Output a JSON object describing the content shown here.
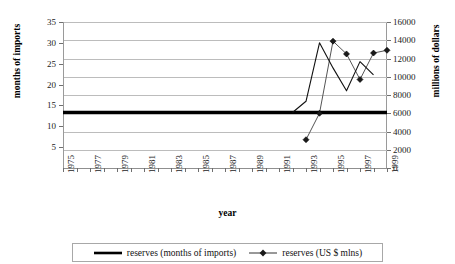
{
  "chart_data": {
    "type": "line",
    "title": "",
    "xlabel": "year",
    "ylabel": "months of imports",
    "y2label": "millions of dollars",
    "grid": true,
    "legend_position": "bottom",
    "x": [
      1975,
      1976,
      1977,
      1978,
      1979,
      1980,
      1981,
      1982,
      1983,
      1984,
      1985,
      1986,
      1987,
      1988,
      1989,
      1990,
      1991,
      1992,
      1993,
      1994,
      1995,
      1996,
      1997,
      1998,
      1999
    ],
    "xtick_labels": [
      "1975",
      "1977",
      "1979",
      "1981",
      "1983",
      "1985",
      "1987",
      "1989",
      "1991",
      "1993",
      "1995",
      "1997",
      "1999"
    ],
    "ylim": [
      0,
      35
    ],
    "ytick_labels": [
      "5",
      "10",
      "15",
      "20",
      "25",
      "30",
      "35"
    ],
    "ytick_values": [
      5,
      10,
      15,
      20,
      25,
      30,
      35
    ],
    "y2lim": [
      0,
      16000
    ],
    "y2tick_labels": [
      "0",
      "2000",
      "4000",
      "6000",
      "8000",
      "10000",
      "12000",
      "14000",
      "16000"
    ],
    "y2tick_values": [
      0,
      2000,
      4000,
      6000,
      8000,
      10000,
      12000,
      14000,
      16000
    ],
    "series": [
      {
        "name": "reserves (months of imports)",
        "axis": "left",
        "style": "thick-line",
        "color": "#000000",
        "x": [
          1975,
          1976,
          1977,
          1978,
          1979,
          1980,
          1981,
          1982,
          1983,
          1984,
          1985,
          1986,
          1987,
          1988,
          1989,
          1990,
          1991,
          1992,
          1993,
          1994,
          1995,
          1996,
          1997,
          1998,
          1999
        ],
        "values": [
          13.3,
          13.3,
          13.3,
          13.3,
          13.3,
          13.3,
          13.3,
          13.3,
          13.3,
          13.3,
          13.3,
          13.3,
          13.3,
          13.3,
          13.3,
          13.3,
          13.3,
          13.3,
          13.3,
          13.3,
          13.3,
          13.3,
          13.3,
          13.3,
          13.3
        ]
      },
      {
        "name": "reserves (US $ mlns)",
        "axis": "right",
        "style": "marker-line",
        "color": "#1a1a1a",
        "marker": "diamond",
        "x": [
          1993,
          1994,
          1995,
          1996,
          1997,
          1998,
          1999
        ],
        "values": [
          3100,
          6000,
          13900,
          12500,
          9700,
          12600,
          12900
        ]
      },
      {
        "name": "reserves (months of imports) detail",
        "axis": "left",
        "style": "thin-line",
        "color": "#111111",
        "x": [
          1992,
          1993,
          1994,
          1995,
          1996,
          1997,
          1998
        ],
        "values": [
          13.3,
          16.0,
          30.0,
          24.0,
          18.5,
          25.5,
          22.3
        ]
      }
    ]
  },
  "legend": {
    "items": [
      {
        "label": "reserves (months of imports)",
        "marker": "thick-line"
      },
      {
        "label": "reserves (US $ mlns)",
        "marker": "diamond-line"
      }
    ]
  }
}
